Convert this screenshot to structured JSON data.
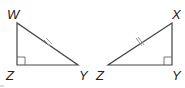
{
  "diagram": {
    "triangles": [
      {
        "name": "triangle-WZY",
        "vertices": [
          {
            "label": "W",
            "x": 17,
            "y": 23,
            "lx": 7,
            "ly": 19
          },
          {
            "label": "Z",
            "x": 17,
            "y": 65,
            "lx": 6,
            "ly": 80
          },
          {
            "label": "Y",
            "x": 78,
            "y": 65,
            "lx": 79,
            "ly": 80
          }
        ],
        "right_angle_at": "Z",
        "congruent_mark_on": "WY"
      },
      {
        "name": "triangle-XYZ",
        "vertices": [
          {
            "label": "X",
            "x": 172,
            "y": 23,
            "lx": 172,
            "ly": 19
          },
          {
            "label": "Z",
            "x": 108,
            "y": 65,
            "lx": 96,
            "ly": 80
          },
          {
            "label": "Y",
            "x": 172,
            "y": 65,
            "lx": 172,
            "ly": 80
          }
        ],
        "right_angle_at": "Y",
        "congruent_mark_on": "XZ"
      }
    ],
    "colors": {
      "edge": "#444444",
      "tick": "#9a9a9a",
      "label": "#222222"
    }
  }
}
